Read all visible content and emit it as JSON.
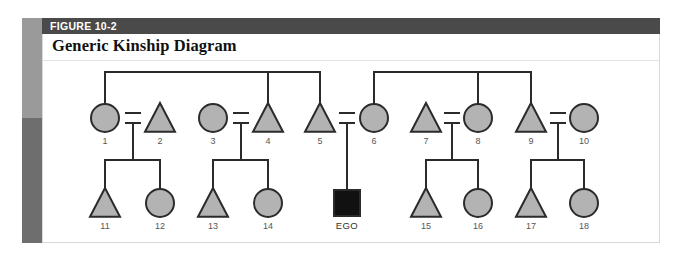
{
  "figure": {
    "number_label": "FIGURE 10-2",
    "title": "Generic Kinship Diagram"
  },
  "colors": {
    "header_bar": "#4a4a4a",
    "spine_top": "#9a9a9a",
    "spine_bottom": "#6e6e6e",
    "symbol_fill": "#b3b3b3",
    "symbol_stroke": "#2b2b2b",
    "ego_fill": "#111111",
    "line": "#2b2b2b",
    "panel_background": "#ffffff",
    "label_text": "#555555"
  },
  "chart_data": {
    "type": "diagram",
    "diagram_kind": "kinship-genealogy",
    "title": "Generic Kinship Diagram",
    "legend_conventions": {
      "circle": "female",
      "triangle": "male",
      "filled_square": "ego (reference person)",
      "equals_sign": "marriage / union",
      "vertical_line": "descent",
      "horizontal_line": "sibling set"
    },
    "generations": [
      {
        "name": "parental-generation",
        "y": 118,
        "nodes": [
          {
            "id": "1",
            "label": "1",
            "shape": "circle",
            "sex": "female",
            "x": 105
          },
          {
            "id": "2",
            "label": "2",
            "shape": "triangle",
            "sex": "male",
            "x": 160
          },
          {
            "id": "3",
            "label": "3",
            "shape": "circle",
            "sex": "female",
            "x": 213
          },
          {
            "id": "4",
            "label": "4",
            "shape": "triangle",
            "sex": "male",
            "x": 268
          },
          {
            "id": "5",
            "label": "5",
            "shape": "triangle",
            "sex": "male",
            "x": 320
          },
          {
            "id": "6",
            "label": "6",
            "shape": "circle",
            "sex": "female",
            "x": 374
          },
          {
            "id": "7",
            "label": "7",
            "shape": "triangle",
            "sex": "male",
            "x": 426
          },
          {
            "id": "8",
            "label": "8",
            "shape": "circle",
            "sex": "female",
            "x": 478
          },
          {
            "id": "9",
            "label": "9",
            "shape": "triangle",
            "sex": "male",
            "x": 531
          },
          {
            "id": "10",
            "label": "10",
            "shape": "circle",
            "sex": "female",
            "x": 584
          }
        ]
      },
      {
        "name": "ego-generation",
        "y": 203,
        "nodes": [
          {
            "id": "11",
            "label": "11",
            "shape": "triangle",
            "sex": "male",
            "x": 105
          },
          {
            "id": "12",
            "label": "12",
            "shape": "circle",
            "sex": "female",
            "x": 160
          },
          {
            "id": "13",
            "label": "13",
            "shape": "triangle",
            "sex": "male",
            "x": 213
          },
          {
            "id": "14",
            "label": "14",
            "shape": "circle",
            "sex": "female",
            "x": 268
          },
          {
            "id": "ego",
            "label": "EGO",
            "shape": "square",
            "sex": "ego",
            "x": 347
          },
          {
            "id": "15",
            "label": "15",
            "shape": "triangle",
            "sex": "male",
            "x": 426
          },
          {
            "id": "16",
            "label": "16",
            "shape": "circle",
            "sex": "female",
            "x": 478
          },
          {
            "id": "17",
            "label": "17",
            "shape": "triangle",
            "sex": "male",
            "x": 531
          },
          {
            "id": "18",
            "label": "18",
            "shape": "circle",
            "sex": "female",
            "x": 584
          }
        ]
      }
    ],
    "marriages": [
      {
        "left": "1",
        "right": "2",
        "x": 133,
        "children": [
          "11",
          "12"
        ]
      },
      {
        "left": "3",
        "right": "4",
        "x": 241,
        "children": [
          "13",
          "14"
        ]
      },
      {
        "left": "5",
        "right": "6",
        "x": 347,
        "children": [
          "ego"
        ]
      },
      {
        "left": "7",
        "right": "8",
        "x": 452,
        "children": [
          "15",
          "16"
        ]
      },
      {
        "left": "9",
        "right": "10",
        "x": 558,
        "children": [
          "17",
          "18"
        ]
      }
    ],
    "sibling_sets": [
      {
        "name": "upper-left-sibship",
        "y": 72,
        "members": [
          "1",
          "4",
          "5"
        ]
      },
      {
        "name": "upper-right-sibship",
        "y": 72,
        "members": [
          "6",
          "8",
          "9"
        ]
      },
      {
        "name": "lower-sibship-1-2",
        "y": 160,
        "members": [
          "11",
          "12"
        ]
      },
      {
        "name": "lower-sibship-3-4",
        "y": 160,
        "members": [
          "13",
          "14"
        ]
      },
      {
        "name": "lower-sibship-7-8",
        "y": 160,
        "members": [
          "15",
          "16"
        ]
      },
      {
        "name": "lower-sibship-9-10",
        "y": 160,
        "members": [
          "17",
          "18"
        ]
      }
    ]
  }
}
